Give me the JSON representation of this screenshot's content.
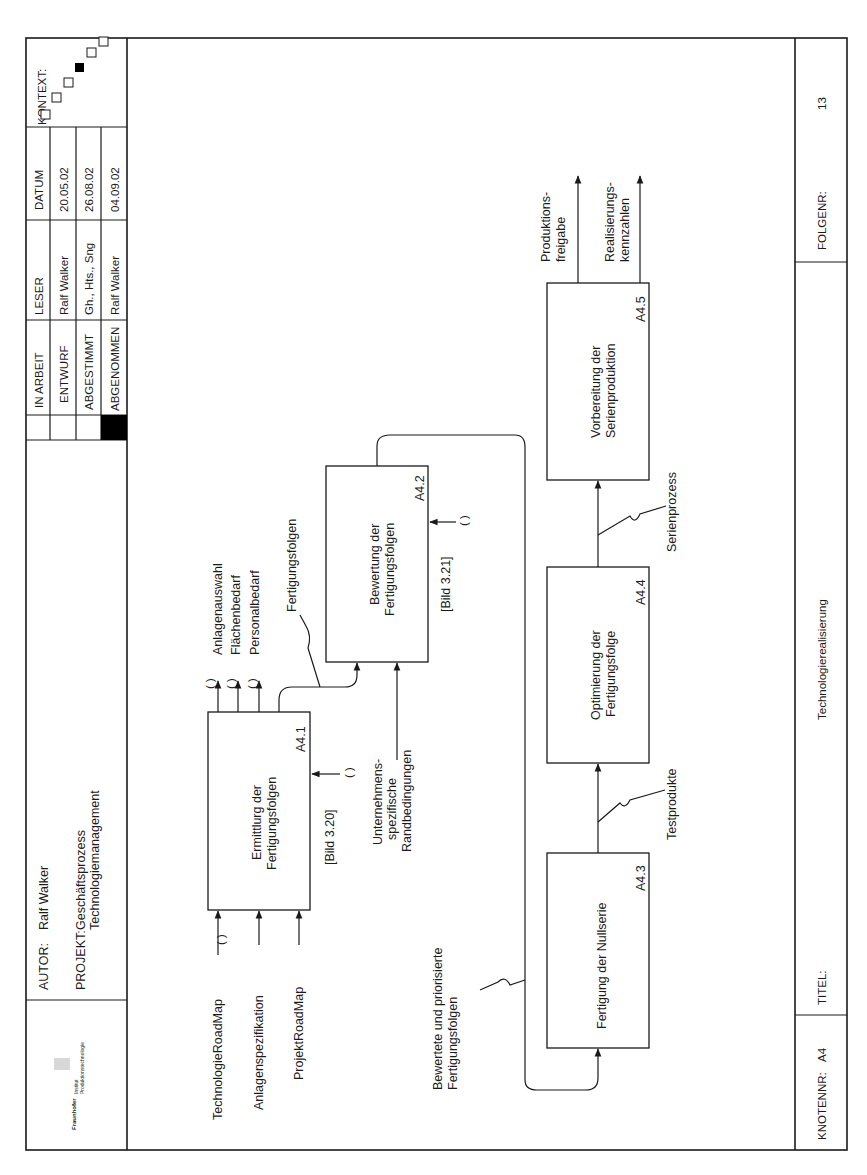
{
  "header": {
    "autor_label": "AUTOR:",
    "autor_value": "Ralf Walker",
    "projekt_label": "PROJEKT:",
    "projekt_line1": "Geschäftsprozess",
    "projekt_line2": "Technologiemanagement",
    "logo_brand": "Fraunhofer",
    "logo_line1": "Institut",
    "logo_line2": "Produktionstechnologie",
    "status_rows": [
      {
        "label": "IN ARBEIT",
        "checked": false
      },
      {
        "label": "ENTWURF",
        "checked": false
      },
      {
        "label": "ABGESTIMMT",
        "checked": false
      },
      {
        "label": "ABGENOMMEN",
        "checked": true
      }
    ],
    "leser_header": "LESER",
    "leser_values": [
      "Ralf Walker",
      "Gh., Hts., Sng",
      "Ralf Walker"
    ],
    "datum_header": "DATUM",
    "datum_values": [
      "20.05.02",
      "26.08.02",
      "04.09.02"
    ],
    "kontext_label": "KONTEXT:",
    "kontext_active_index": 2
  },
  "footer": {
    "knotennr_label": "KNOTENNR:",
    "knotennr_value": "A4",
    "titel_label": "TITEL:",
    "titel_value": "Technologierealisierung",
    "folgenr_label": "FOLGENR:",
    "folgenr_value": "13"
  },
  "boxes": [
    {
      "id": "A4.1",
      "line1": "Ermittlurg der",
      "line2": "Fertigungsfolgen",
      "ref": "[Bild 3.20]"
    },
    {
      "id": "A4.2",
      "line1": "Bewertung der",
      "line2": "Fertigungsfolgen",
      "ref": "[Bild 3.21]"
    },
    {
      "id": "A4.3",
      "line1": "Fertigung der Nullserie",
      "line2": ""
    },
    {
      "id": "A4.4",
      "line1": "Optimierung der",
      "line2": "Fertigungsfolge"
    },
    {
      "id": "A4.5",
      "line1": "Vorbereitung der",
      "line2": "Serienproduktion"
    }
  ],
  "arrows": {
    "inputs": [
      "TechnologieRoadMap",
      "Anlagenspezifikation",
      "ProjektRoadMap"
    ],
    "a41_outputs": [
      "Anlagenauswahl",
      "Flächenbedarf",
      "Personalbedarf"
    ],
    "a41_to_a42": "Fertigungsfolgen",
    "control_line1": "Unternehmens-",
    "control_line2": "spezifische",
    "control_line3": "Randbedingungen",
    "a42_to_a43_line1": "Bewertete und priorisierte",
    "a42_to_a43_line2": "Fertigungsfolgen",
    "a43_to_a44": "Testprodukte",
    "a44_to_a45": "Serienprozess",
    "out1_line1": "Produktions-",
    "out1_line2": "freigabe",
    "out2_line1": "Realisierungs-",
    "out2_line2": "kennzahlen",
    "tunnel": "( )"
  }
}
